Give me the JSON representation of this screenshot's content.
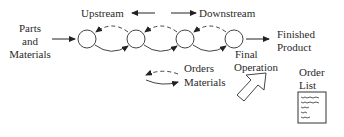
{
  "labels": {
    "upstream": "Upstream",
    "downstream": "Downstream",
    "parts_line1": "Parts",
    "parts_line2": "and",
    "parts_line3": "Materials",
    "finished_line1": "Finished",
    "finished_line2": "Product",
    "final_line1": "Final",
    "final_line2": "Operation",
    "legend_orders": "Orders",
    "legend_materials": "Materials",
    "order_list_line1": "Order",
    "order_list_line2": "List"
  },
  "diagram": {
    "nodes": 4,
    "flows": {
      "orders": "dashed, right-to-left (upstream)",
      "materials": "solid, left-to-right (downstream)"
    }
  }
}
